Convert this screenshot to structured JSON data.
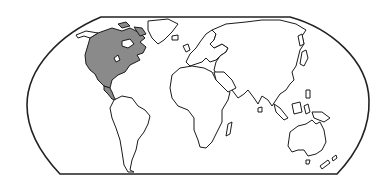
{
  "map": {
    "title": "World map with North America highlighted",
    "projection": "Robinson-style (flat poles)",
    "highlighted_region": "North America",
    "colors": {
      "background": "#ffffff",
      "outline": "#1a1a1a",
      "highlight_fill": "#8a8a8a",
      "land_fill": "#ffffff"
    },
    "regions": [
      {
        "id": "north-america",
        "label": "North America",
        "highlighted": true
      },
      {
        "id": "greenland",
        "label": "Greenland",
        "highlighted": false
      },
      {
        "id": "south-america",
        "label": "South America",
        "highlighted": false
      },
      {
        "id": "europe",
        "label": "Europe",
        "highlighted": false
      },
      {
        "id": "africa",
        "label": "Africa",
        "highlighted": false
      },
      {
        "id": "asia",
        "label": "Asia",
        "highlighted": false
      },
      {
        "id": "oceania",
        "label": "Australia / Oceania",
        "highlighted": false
      }
    ]
  }
}
